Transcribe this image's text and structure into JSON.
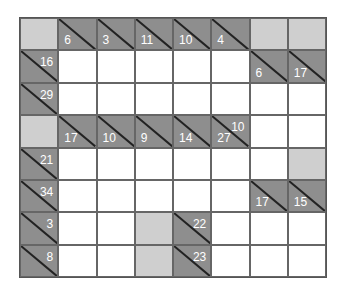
{
  "puzzle": {
    "type": "kakuro",
    "rows": 8,
    "cols": 8,
    "colors": {
      "clue": "#8e8e8e",
      "blank": "#cfcfcf",
      "white": "#ffffff",
      "text": "#ffffff"
    },
    "grid": [
      [
        {
          "t": "blank"
        },
        {
          "t": "clue",
          "down": "6"
        },
        {
          "t": "clue",
          "down": "3"
        },
        {
          "t": "clue",
          "down": "11"
        },
        {
          "t": "clue",
          "down": "10"
        },
        {
          "t": "clue",
          "down": "4"
        },
        {
          "t": "blank"
        },
        {
          "t": "blank"
        }
      ],
      [
        {
          "t": "clue",
          "across": "16"
        },
        {
          "t": "white"
        },
        {
          "t": "white"
        },
        {
          "t": "white"
        },
        {
          "t": "white"
        },
        {
          "t": "white"
        },
        {
          "t": "clue",
          "down": "6"
        },
        {
          "t": "clue",
          "down": "17"
        }
      ],
      [
        {
          "t": "clue",
          "across": "29"
        },
        {
          "t": "white"
        },
        {
          "t": "white"
        },
        {
          "t": "white"
        },
        {
          "t": "white"
        },
        {
          "t": "white"
        },
        {
          "t": "white"
        },
        {
          "t": "white"
        }
      ],
      [
        {
          "t": "blank"
        },
        {
          "t": "clue",
          "down": "17"
        },
        {
          "t": "clue",
          "down": "10"
        },
        {
          "t": "clue",
          "down": "9"
        },
        {
          "t": "clue",
          "down": "14"
        },
        {
          "t": "clue",
          "down": "27",
          "across": "10"
        },
        {
          "t": "white"
        },
        {
          "t": "white"
        }
      ],
      [
        {
          "t": "clue",
          "across": "21"
        },
        {
          "t": "white"
        },
        {
          "t": "white"
        },
        {
          "t": "white"
        },
        {
          "t": "white"
        },
        {
          "t": "white"
        },
        {
          "t": "white"
        },
        {
          "t": "blank"
        }
      ],
      [
        {
          "t": "clue",
          "across": "34"
        },
        {
          "t": "white"
        },
        {
          "t": "white"
        },
        {
          "t": "white"
        },
        {
          "t": "white"
        },
        {
          "t": "white"
        },
        {
          "t": "clue",
          "down": "17"
        },
        {
          "t": "clue",
          "down": "15"
        }
      ],
      [
        {
          "t": "clue",
          "across": "3"
        },
        {
          "t": "white"
        },
        {
          "t": "white"
        },
        {
          "t": "blank"
        },
        {
          "t": "clue",
          "across": "22"
        },
        {
          "t": "white"
        },
        {
          "t": "white"
        },
        {
          "t": "white"
        }
      ],
      [
        {
          "t": "clue",
          "across": "8"
        },
        {
          "t": "white"
        },
        {
          "t": "white"
        },
        {
          "t": "blank"
        },
        {
          "t": "clue",
          "across": "23"
        },
        {
          "t": "white"
        },
        {
          "t": "white"
        },
        {
          "t": "white"
        }
      ]
    ]
  }
}
